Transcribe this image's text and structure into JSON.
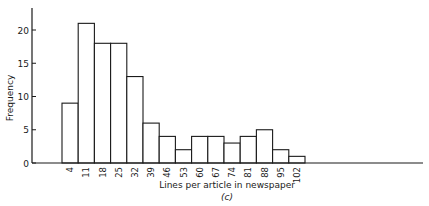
{
  "chart_data": {
    "type": "bar",
    "subtype": "histogram",
    "title": "",
    "caption": "(c)",
    "xlabel": "Lines per article in newspaper",
    "ylabel": "Frequency",
    "categories": [
      "4",
      "11",
      "18",
      "25",
      "32",
      "39",
      "46",
      "53",
      "60",
      "67",
      "74",
      "81",
      "88",
      "95",
      "102"
    ],
    "values": [
      9,
      21,
      18,
      18,
      13,
      6,
      4,
      2,
      4,
      4,
      3,
      4,
      5,
      2,
      1
    ],
    "ylim": [
      0,
      23
    ],
    "yticks": [
      0,
      5,
      10,
      15,
      20
    ],
    "grid": false,
    "legend": null,
    "bar_fill": "#ffffff",
    "bar_stroke": "#1a1a1a"
  },
  "layout": {
    "axis_left_x": 32,
    "axis_top_y": 8,
    "baseline_y": 163,
    "axis_right_x": 423,
    "first_bar_x": 62,
    "bar_width": 16.2,
    "px_per_unit": 6.65
  }
}
